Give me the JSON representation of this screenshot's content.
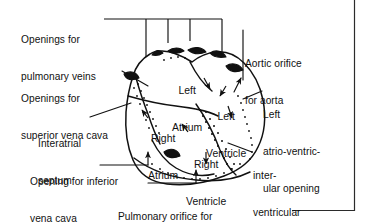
{
  "figure": {
    "kind": "anatomical-line-diagram",
    "line_color": "#111111",
    "background_color": "#ffffff",
    "frame": {
      "right_rule_x": 354,
      "bottom_rule_y": 210
    }
  },
  "callouts": {
    "pulmonary_veins": {
      "line1": "Openings for",
      "line2": "pulmonary veins"
    },
    "superior_vena_cava": {
      "line1": "Openings for",
      "line2": "superior vena cava"
    },
    "interatrial_septum": {
      "line1": "Interatrial",
      "line2": "septum"
    },
    "inferior_vena_cava": {
      "line1": "Opening for inferior",
      "line2": "vena cava"
    },
    "pulmonary_orifice": {
      "line1": "Pulmonary orifice for",
      "line2": "pulmonary trunk"
    },
    "aortic_orifice": {
      "line1": "Aortic orifice",
      "line2": "for aorta"
    },
    "left_av_opening": {
      "line1": "Left",
      "line2": "atrio-ventric-",
      "line3": "ular opening"
    },
    "interventricular_septum": {
      "line1": "inter-",
      "line2": "ventricular",
      "line3": "septum"
    }
  },
  "chambers": {
    "left_atrium": {
      "line1": "Left",
      "line2": "Atrium"
    },
    "right_atrium": {
      "line1": "Right",
      "line2": "Atrium"
    },
    "left_ventricle": {
      "line1": "Left",
      "line2": "Ventricle"
    },
    "right_ventricle": {
      "line1": "Right",
      "line2": "Ventricle"
    }
  }
}
